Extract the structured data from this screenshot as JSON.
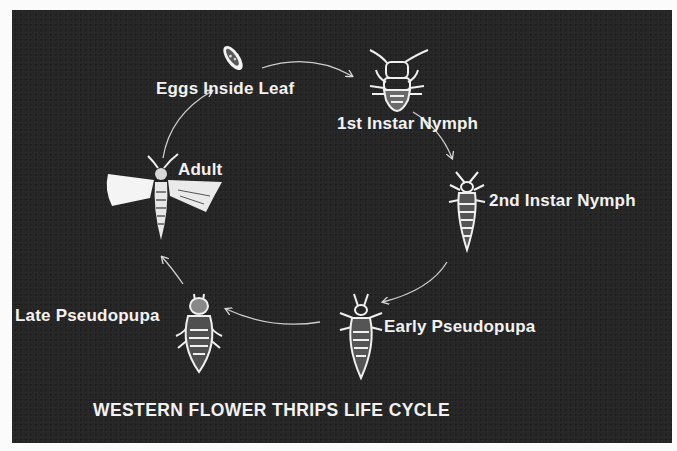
{
  "diagram": {
    "title": "WESTERN FLOWER THRIPS LIFE CYCLE",
    "background_color": "#262626",
    "text_color": "#f2f2f2",
    "stages": [
      {
        "id": "eggs",
        "label": "Eggs Inside Leaf",
        "icon": "egg-icon"
      },
      {
        "id": "nymph1",
        "label": "1st Instar Nymph",
        "icon": "first-instar-nymph-icon"
      },
      {
        "id": "nymph2",
        "label": "2nd Instar Nymph",
        "icon": "second-instar-nymph-icon"
      },
      {
        "id": "early_pupa",
        "label": "Early Pseudopupa",
        "icon": "early-pseudopupa-icon"
      },
      {
        "id": "late_pupa",
        "label": "Late Pseudopupa",
        "icon": "late-pseudopupa-icon"
      },
      {
        "id": "adult",
        "label": "Adult",
        "icon": "adult-thrips-icon"
      }
    ],
    "cycle_order": [
      "eggs",
      "nymph1",
      "nymph2",
      "early_pupa",
      "late_pupa",
      "adult",
      "eggs"
    ]
  }
}
